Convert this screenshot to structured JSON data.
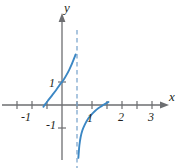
{
  "chart_data": {
    "type": "line",
    "title": "",
    "xlabel": "x",
    "ylabel": "y",
    "xlim": [
      -1.75,
      3.6
    ],
    "ylim": [
      -2.3,
      2.4
    ],
    "grid": false,
    "legend": null,
    "x_ticks": [
      -1,
      1,
      2,
      3
    ],
    "x_tick_labels": [
      "-1",
      "1",
      "2",
      "3"
    ],
    "x_minor_ticks": [
      -1.5,
      -0.5,
      0.5,
      1.5,
      2.5
    ],
    "y_ticks": [
      -1,
      1
    ],
    "y_tick_labels": [
      "-1",
      "1"
    ],
    "annotations": [
      {
        "name": "vertical-asymptote",
        "kind": "dashed-vertical-line",
        "x": 0.5,
        "y_from": -2.3,
        "y_to": 2.0,
        "color": "#7fa8cf"
      }
    ],
    "series": [
      {
        "name": "left-branch",
        "color": "#3b87c4",
        "x": [
          -0.62,
          -0.55,
          -0.45,
          -0.33,
          -0.2,
          -0.08,
          0.0,
          0.08,
          0.16,
          0.24,
          0.3,
          0.35,
          0.39,
          0.42,
          0.44,
          0.455
        ],
        "y": [
          -0.08,
          0.05,
          0.22,
          0.42,
          0.64,
          0.87,
          1.0,
          1.15,
          1.33,
          1.53,
          1.7,
          1.85,
          1.98,
          2.08,
          2.15,
          2.2
        ]
      },
      {
        "name": "right-branch",
        "color": "#3b87c4",
        "x": [
          0.545,
          0.56,
          0.58,
          0.62,
          0.68,
          0.76,
          0.86,
          0.98,
          1.1,
          1.22,
          1.32,
          1.4,
          1.48,
          1.55
        ],
        "y": [
          -2.3,
          -2.05,
          -1.75,
          -1.4,
          -1.1,
          -0.85,
          -0.62,
          -0.42,
          -0.26,
          -0.13,
          -0.05,
          0.02,
          0.08,
          0.13
        ]
      }
    ],
    "colors": {
      "curve": "#3b87c4",
      "asymptote": "#7fa8cf",
      "axis": "#6d6e71",
      "text": "#231f20",
      "background": "#ffffff"
    }
  }
}
